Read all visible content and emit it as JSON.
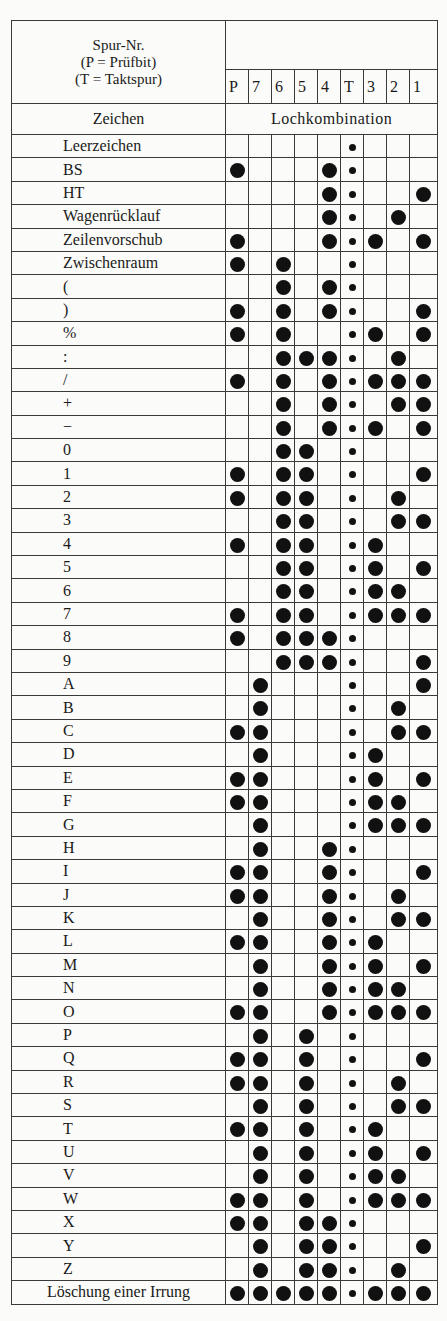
{
  "header": {
    "label_lines": [
      "Spur-Nr.",
      "(P = Prüfbit)",
      "(T = Taktspur)"
    ],
    "tracks": [
      "P",
      "7",
      "6",
      "5",
      "4",
      "T",
      "3",
      "2",
      "1"
    ],
    "subheader_left": "Zeichen",
    "subheader_right": "Lochkombination"
  },
  "legend": {
    "large_dot": "hole-punched",
    "small_dot": "feed-hole (Taktspur)"
  },
  "rows": [
    {
      "label": "Leerzeichen",
      "holes": []
    },
    {
      "label": "BS",
      "holes": [
        "P",
        "4"
      ]
    },
    {
      "label": "HT",
      "holes": [
        "4",
        "1"
      ]
    },
    {
      "label": "Wagenrücklauf",
      "holes": [
        "4",
        "2"
      ]
    },
    {
      "label": "Zeilenvorschub",
      "holes": [
        "P",
        "4",
        "3",
        "1"
      ]
    },
    {
      "label": "Zwischenraum",
      "holes": [
        "P",
        "6"
      ]
    },
    {
      "label": "(",
      "holes": [
        "6",
        "4"
      ]
    },
    {
      "label": ")",
      "holes": [
        "P",
        "6",
        "4",
        "1"
      ]
    },
    {
      "label": "%",
      "holes": [
        "P",
        "6",
        "3",
        "1"
      ]
    },
    {
      "label": ":",
      "holes": [
        "6",
        "5",
        "4",
        "2"
      ]
    },
    {
      "label": "/",
      "holes": [
        "P",
        "6",
        "4",
        "3",
        "2",
        "1"
      ]
    },
    {
      "label": "+",
      "holes": [
        "6",
        "4",
        "2",
        "1"
      ]
    },
    {
      "label": "−",
      "holes": [
        "6",
        "4",
        "3",
        "1"
      ]
    },
    {
      "label": "0",
      "holes": [
        "6",
        "5"
      ]
    },
    {
      "label": "1",
      "holes": [
        "P",
        "6",
        "5",
        "1"
      ]
    },
    {
      "label": "2",
      "holes": [
        "P",
        "6",
        "5",
        "2"
      ]
    },
    {
      "label": "3",
      "holes": [
        "6",
        "5",
        "2",
        "1"
      ]
    },
    {
      "label": "4",
      "holes": [
        "P",
        "6",
        "5",
        "3"
      ]
    },
    {
      "label": "5",
      "holes": [
        "6",
        "5",
        "3",
        "1"
      ]
    },
    {
      "label": "6",
      "holes": [
        "6",
        "5",
        "3",
        "2"
      ]
    },
    {
      "label": "7",
      "holes": [
        "P",
        "6",
        "5",
        "3",
        "2",
        "1"
      ]
    },
    {
      "label": "8",
      "holes": [
        "P",
        "6",
        "5",
        "4"
      ]
    },
    {
      "label": "9",
      "holes": [
        "6",
        "5",
        "4",
        "1"
      ]
    },
    {
      "label": "A",
      "holes": [
        "7",
        "1"
      ]
    },
    {
      "label": "B",
      "holes": [
        "7",
        "2"
      ]
    },
    {
      "label": "C",
      "holes": [
        "P",
        "7",
        "2",
        "1"
      ]
    },
    {
      "label": "D",
      "holes": [
        "7",
        "3"
      ]
    },
    {
      "label": "E",
      "holes": [
        "P",
        "7",
        "3",
        "1"
      ]
    },
    {
      "label": "F",
      "holes": [
        "P",
        "7",
        "3",
        "2"
      ]
    },
    {
      "label": "G",
      "holes": [
        "7",
        "3",
        "2",
        "1"
      ]
    },
    {
      "label": "H",
      "holes": [
        "7",
        "4"
      ]
    },
    {
      "label": "I",
      "holes": [
        "P",
        "7",
        "4",
        "1"
      ]
    },
    {
      "label": "J",
      "holes": [
        "P",
        "7",
        "4",
        "2"
      ]
    },
    {
      "label": "K",
      "holes": [
        "7",
        "4",
        "2",
        "1"
      ]
    },
    {
      "label": "L",
      "holes": [
        "P",
        "7",
        "4",
        "3"
      ]
    },
    {
      "label": "M",
      "holes": [
        "7",
        "4",
        "3",
        "1"
      ]
    },
    {
      "label": "N",
      "holes": [
        "7",
        "4",
        "3",
        "2"
      ]
    },
    {
      "label": "O",
      "holes": [
        "P",
        "7",
        "4",
        "3",
        "2",
        "1"
      ]
    },
    {
      "label": "P",
      "holes": [
        "7",
        "5"
      ]
    },
    {
      "label": "Q",
      "holes": [
        "P",
        "7",
        "5",
        "1"
      ]
    },
    {
      "label": "R",
      "holes": [
        "P",
        "7",
        "5",
        "2"
      ]
    },
    {
      "label": "S",
      "holes": [
        "7",
        "5",
        "2",
        "1"
      ]
    },
    {
      "label": "T",
      "holes": [
        "P",
        "7",
        "5",
        "3"
      ]
    },
    {
      "label": "U",
      "holes": [
        "7",
        "5",
        "3",
        "1"
      ]
    },
    {
      "label": "V",
      "holes": [
        "7",
        "5",
        "3",
        "2"
      ]
    },
    {
      "label": "W",
      "holes": [
        "P",
        "7",
        "5",
        "3",
        "2",
        "1"
      ]
    },
    {
      "label": "X",
      "holes": [
        "P",
        "7",
        "5",
        "4"
      ]
    },
    {
      "label": "Y",
      "holes": [
        "7",
        "5",
        "4",
        "1"
      ]
    },
    {
      "label": "Z",
      "holes": [
        "7",
        "5",
        "4",
        "2"
      ]
    },
    {
      "label": "Löschung einer Irrung",
      "holes": [
        "P",
        "7",
        "6",
        "5",
        "4",
        "3",
        "2",
        "1"
      ],
      "centered": true
    }
  ]
}
